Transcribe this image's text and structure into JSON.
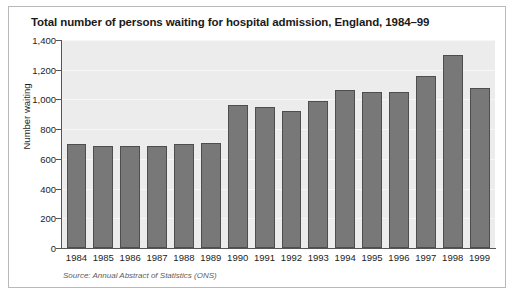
{
  "chart_data": {
    "type": "bar",
    "title": "Total number of persons waiting for hospital admission, England, 1984–99",
    "xlabel": "",
    "ylabel": "Number waiting",
    "categories": [
      "1984",
      "1985",
      "1986",
      "1987",
      "1988",
      "1989",
      "1990",
      "1991",
      "1992",
      "1993",
      "1994",
      "1995",
      "1996",
      "1997",
      "1998",
      "1999"
    ],
    "values": [
      700,
      690,
      690,
      690,
      700,
      710,
      965,
      950,
      925,
      990,
      1065,
      1050,
      1050,
      1155,
      1300,
      1080
    ],
    "ylim": [
      0,
      1400
    ],
    "ytick_values": [
      0,
      200,
      400,
      600,
      800,
      1000,
      1200,
      1400
    ],
    "ytick_labels": [
      "0",
      "200",
      "400",
      "600",
      "800",
      "1,000",
      "1,200",
      "1,400"
    ],
    "grid": true,
    "legend": false,
    "source_note": "Source: Annual Abstract of Statistics (ONS)",
    "colors": {
      "bar_fill": "#787878",
      "bar_edge": "#4e4e4e",
      "plot_background": "#ececec",
      "gridline": "#f7f7f7",
      "axis": "#555555",
      "title_text": "#1a1a1a",
      "tick_text": "#232323",
      "source_text": "#5d5d5d",
      "figure_border": "#b9b9b9",
      "figure_background": "#ffffff"
    }
  }
}
